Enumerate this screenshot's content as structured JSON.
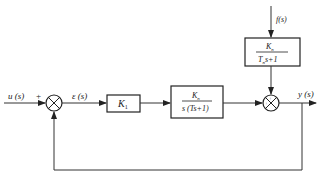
{
  "diagram": {
    "type": "control-system-block-diagram",
    "signals": {
      "input": "u (s)",
      "error": "ε (s)",
      "disturbance": "f(s)",
      "output": "y (s)"
    },
    "junctions": {
      "input_sum": {
        "sign_input": "+",
        "sign_feedback": ""
      },
      "disturbance_sum": {
        "sign_top": "+",
        "sign_left": "+"
      }
    },
    "blocks": {
      "controller": {
        "label": "K",
        "subscript": "1"
      },
      "plant": {
        "numerator": "K",
        "numerator_sub": "n",
        "denominator": "s (Ts+1)"
      },
      "disturbance": {
        "numerator": "K",
        "numerator_sub": "n",
        "den_T": "T",
        "den_sub": "n",
        "den_rest": "s+1"
      }
    },
    "feedback": "unity negative feedback from y(s) to input summing junction"
  }
}
